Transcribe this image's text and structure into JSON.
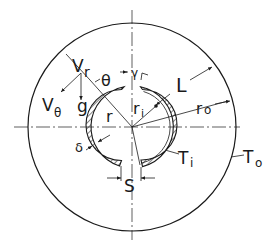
{
  "diagram": {
    "colors": {
      "ink": "#1a1a1a",
      "background": "#ffffff"
    },
    "geometry": {
      "center": [
        132,
        127
      ],
      "outer_radius": 104,
      "inner_ring_inner_radius": 34,
      "inner_ring_outer_radius": 41
    },
    "labels": {
      "v_r": "V",
      "v_r_sub": "r",
      "v_theta": "V",
      "v_theta_sub": "θ",
      "g": "g",
      "theta": "θ",
      "gamma": "γ",
      "r": "r",
      "r_i": "r",
      "r_i_sub": "i",
      "r_o": "r",
      "r_o_sub": "o",
      "L": "L",
      "delta": "δ",
      "S": "S",
      "T_i": "T",
      "T_i_sub": "i",
      "T_o": "T",
      "T_o_sub": "o"
    }
  }
}
